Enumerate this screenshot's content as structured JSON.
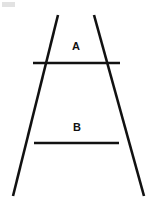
{
  "figure": {
    "background_color": "#ffffff",
    "stroke_color": "#111111",
    "width": 159,
    "height": 210,
    "labels": {
      "upper": "A",
      "lower": "B"
    },
    "segments": {
      "left_diagonal": {
        "name": "left-diagonal",
        "x1": 58,
        "y1": 15,
        "x2": 13,
        "y2": 196
      },
      "right_diagonal": {
        "name": "right-diagonal",
        "x1": 94,
        "y1": 15,
        "x2": 144,
        "y2": 196
      },
      "line_a": {
        "name": "horizontal-line-a",
        "x1": 33,
        "y1": 63,
        "x2": 120,
        "y2": 63
      },
      "line_b": {
        "name": "horizontal-line-b",
        "x1": 34,
        "y1": 143,
        "x2": 119,
        "y2": 143
      }
    }
  }
}
